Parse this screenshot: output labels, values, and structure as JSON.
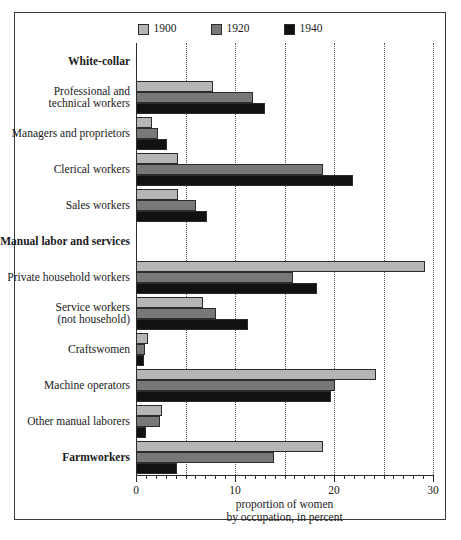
{
  "chart_data": {
    "type": "bar",
    "orientation": "horizontal",
    "title": "",
    "xlabel": "proportion of women by occupation, in percent",
    "xlabel_line1": "proportion of women",
    "xlabel_line2": "by occupation, in percent",
    "ylabel": "",
    "xlim": [
      0,
      30
    ],
    "xticks": [
      0,
      10,
      20,
      30
    ],
    "xtick_labels": [
      "0",
      "10",
      "20",
      "30"
    ],
    "gridlines": [
      5,
      10,
      15,
      20,
      25,
      30
    ],
    "grid": true,
    "legend_position": "top-center",
    "legend": [
      "1900",
      "1920",
      "1940"
    ],
    "series": [
      {
        "name": "1900",
        "color": "#b5b5b5",
        "values": [
          null,
          7.8,
          1.6,
          4.2,
          4.2,
          null,
          29.2,
          6.8,
          1.2,
          24.2,
          2.6,
          18.9
        ]
      },
      {
        "name": "1920",
        "color": "#787878",
        "values": [
          null,
          11.8,
          2.2,
          18.9,
          6.1,
          null,
          15.9,
          8.1,
          0.9,
          20.1,
          2.4,
          13.9
        ]
      },
      {
        "name": "1940",
        "color": "#111111",
        "values": [
          null,
          13.0,
          3.1,
          21.9,
          7.2,
          null,
          18.3,
          11.3,
          0.8,
          19.7,
          1.0,
          4.1
        ]
      }
    ],
    "categories": [
      "White-collar",
      "Professional and technical workers",
      "Managers and proprietors",
      "Clerical workers",
      "Sales workers",
      "Manual labor and services",
      "Private household workers",
      "Service workers (not household)",
      "Craftswomen",
      "Machine operators",
      "Other manual laborers",
      "Farmworkers"
    ],
    "rows": [
      {
        "label_lines": [
          "White-collar"
        ],
        "heading": true,
        "values": []
      },
      {
        "label_lines": [
          "Professional and",
          "technical workers"
        ],
        "heading": false,
        "values": [
          7.8,
          11.8,
          13.0
        ]
      },
      {
        "label_lines": [
          "Managers and proprietors"
        ],
        "heading": false,
        "values": [
          1.6,
          2.2,
          3.1
        ]
      },
      {
        "label_lines": [
          "Clerical workers"
        ],
        "heading": false,
        "values": [
          4.2,
          18.9,
          21.9
        ]
      },
      {
        "label_lines": [
          "Sales workers"
        ],
        "heading": false,
        "values": [
          4.2,
          6.1,
          7.2
        ]
      },
      {
        "label_lines": [
          "Manual labor and services"
        ],
        "heading": true,
        "values": []
      },
      {
        "label_lines": [
          "Private household workers"
        ],
        "heading": false,
        "values": [
          29.2,
          15.9,
          18.3
        ]
      },
      {
        "label_lines": [
          "Service workers",
          "(not household)"
        ],
        "heading": false,
        "values": [
          6.8,
          8.1,
          11.3
        ]
      },
      {
        "label_lines": [
          "Craftswomen"
        ],
        "heading": false,
        "values": [
          1.2,
          0.9,
          0.8
        ]
      },
      {
        "label_lines": [
          "Machine operators"
        ],
        "heading": false,
        "values": [
          24.2,
          20.1,
          19.7
        ]
      },
      {
        "label_lines": [
          "Other manual laborers"
        ],
        "heading": false,
        "values": [
          2.6,
          2.4,
          1.0
        ]
      },
      {
        "label_lines": [
          "Farmworkers"
        ],
        "heading": true,
        "values": [
          18.9,
          13.9,
          4.1
        ]
      }
    ]
  },
  "colors": {
    "series_1900": "#b5b5b5",
    "series_1920": "#787878",
    "series_1940": "#111111",
    "frame": "#3a3a3a",
    "grid": "#555555",
    "text": "#1a1a1a"
  }
}
